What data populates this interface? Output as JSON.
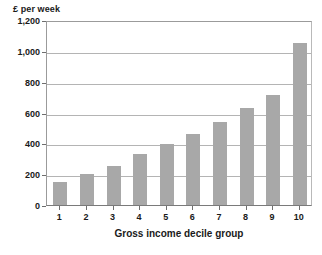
{
  "chart_data": {
    "type": "bar",
    "title": "",
    "subtitle": "",
    "xlabel": "Gross income decile group",
    "ylabel": "£ per week",
    "categories": [
      "1",
      "2",
      "3",
      "4",
      "5",
      "6",
      "7",
      "8",
      "9",
      "10"
    ],
    "values": [
      150,
      200,
      253,
      330,
      395,
      458,
      537,
      627,
      713,
      1048
    ],
    "ylim": [
      0,
      1200
    ],
    "yticks": [
      0,
      200,
      400,
      600,
      800,
      1000,
      1200
    ],
    "ytick_labels": [
      "0",
      "200",
      "400",
      "600",
      "800",
      "1,000",
      "1,200"
    ],
    "grid": "horizontal",
    "legend": "none",
    "bar_color": "#a8a8a8",
    "gridline_color": "#b4b4b4",
    "axis_color": "#6e6e6e",
    "background_color": "#ffffff",
    "series": [
      {
        "name": "£ per week",
        "values": [
          150,
          200,
          253,
          330,
          395,
          458,
          537,
          627,
          713,
          1048
        ]
      }
    ]
  }
}
